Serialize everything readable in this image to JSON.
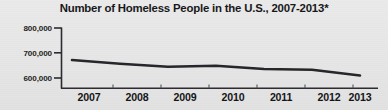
{
  "chart_data": {
    "type": "line",
    "title": "Number of Homeless People in the U.S., 2007-2013*",
    "xlabel": "",
    "ylabel": "",
    "categories": [
      "2007",
      "2008",
      "2009",
      "2010",
      "2011",
      "2012",
      "2013"
    ],
    "values": [
      672000,
      657000,
      645000,
      649000,
      636000,
      633000,
      610000
    ],
    "series": [
      {
        "name": "Number of Homeless People",
        "values": [
          672000,
          657000,
          645000,
          649000,
          636000,
          633000,
          610000
        ]
      }
    ],
    "ylim": [
      560000,
      800000
    ],
    "yticks": [
      600000,
      700000,
      800000
    ],
    "ytick_labels": [
      "600,000",
      "700,000",
      "800,000"
    ],
    "xtick_labels": [
      "2007",
      "2008",
      "2009",
      "2010",
      "2011",
      "2012",
      "2013"
    ],
    "grid": false,
    "legend": null,
    "legend_position": "none",
    "annotations": [
      "*"
    ],
    "line_color": "#26262a",
    "background_color": "#e7e7e7",
    "axis_color": "#2b2b2f"
  },
  "axis": {
    "y_ticks": [
      {
        "label": "800,000",
        "value": 800000
      },
      {
        "label": "700,000",
        "value": 700000
      },
      {
        "label": "600,000",
        "value": 600000
      }
    ],
    "x_ticks": [
      {
        "label": "2007"
      },
      {
        "label": "2008"
      },
      {
        "label": "2009"
      },
      {
        "label": "2010"
      },
      {
        "label": "2011"
      },
      {
        "label": "2012"
      },
      {
        "label": "2013"
      }
    ]
  }
}
